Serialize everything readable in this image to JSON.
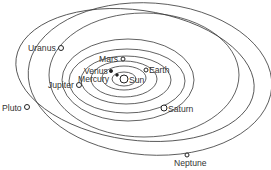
{
  "sun": {
    "label": "Sun",
    "x": 125,
    "y": 79
  },
  "planets": [
    {
      "name": "mercury",
      "label": "Mercury"
    },
    {
      "name": "venus",
      "label": "Venus"
    },
    {
      "name": "earth",
      "label": "Earth"
    },
    {
      "name": "mars",
      "label": "Mars"
    },
    {
      "name": "jupiter",
      "label": "Jupiter"
    },
    {
      "name": "saturn",
      "label": "Saturn"
    },
    {
      "name": "uranus",
      "label": "Uranus"
    },
    {
      "name": "neptune",
      "label": "Neptune"
    },
    {
      "name": "pluto",
      "label": "Pluto"
    }
  ]
}
